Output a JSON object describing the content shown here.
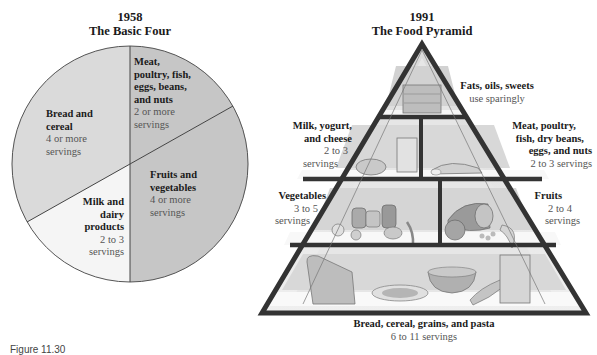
{
  "left_figure": {
    "year": "1958",
    "title": "The Basic Four",
    "segments": [
      {
        "name": "Meat, poultry, fish, eggs, beans, and nuts",
        "lines": [
          "Meat,",
          "poultry, fish,",
          "eggs, beans,",
          "and nuts"
        ],
        "servings": [
          "2 or more",
          "servings"
        ],
        "color": "#c6c6c6"
      },
      {
        "name": "Bread and cereal",
        "lines": [
          "Bread and",
          "cereal"
        ],
        "servings": [
          "4 or more",
          "servings"
        ],
        "color": "#dadada"
      },
      {
        "name": "Fruits and vegetables",
        "lines": [
          "Fruits and",
          "vegetables"
        ],
        "servings": [
          "4 or more",
          "servings"
        ],
        "color": "#c6c6c6"
      },
      {
        "name": "Milk and dairy products",
        "lines": [
          "Milk and",
          "dairy",
          "products"
        ],
        "servings": [
          "2 to 3",
          "servings"
        ],
        "color": "#f5f5f5"
      }
    ]
  },
  "right_figure": {
    "year": "1991",
    "title": "The Food Pyramid",
    "tiers": [
      {
        "name": "Fats, oils, sweets",
        "servings": "use sparingly"
      },
      {
        "name": "Milk, yogurt, and cheese",
        "lines": [
          "Milk, yogurt,",
          "and cheese"
        ],
        "servings": [
          "2 to 3",
          "servings"
        ]
      },
      {
        "name": "Meat, poultry, fish, dry beans, eggs, and nuts",
        "lines": [
          "Meat, poultry,",
          "fish, dry beans,",
          "eggs, and nuts"
        ],
        "servings": [
          "2 to 3 servings"
        ]
      },
      {
        "name": "Vegetables",
        "lines": [
          "Vegetables"
        ],
        "servings": [
          "3 to 5",
          "servings"
        ]
      },
      {
        "name": "Fruits",
        "lines": [
          "Fruits"
        ],
        "servings": [
          "2 to 4",
          "servings"
        ]
      },
      {
        "name": "Bread, cereal, grains, and pasta",
        "servings": "6 to 11 servings"
      }
    ]
  },
  "caption": "Figure 11.30"
}
